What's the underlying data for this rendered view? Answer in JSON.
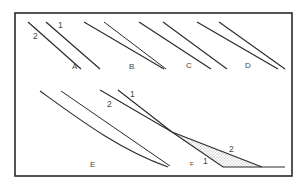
{
  "diagram": {
    "colors": {
      "background": "#ffffff",
      "frame": "#2a2a2a",
      "line": "#2a2a2a",
      "label": "#444444",
      "shade": "#bdbdbd"
    },
    "frame": {
      "x": 15,
      "y": 13,
      "width": 277,
      "height": 163
    },
    "panels": [
      {
        "id": "A",
        "label": "A",
        "label_pos": [
          72,
          69
        ],
        "lines": [
          {
            "name": "1",
            "points": [
              [
                46,
                22
              ],
              [
                100,
                69
              ]
            ]
          },
          {
            "name": "2",
            "points": [
              [
                28,
                22
              ],
              [
                81,
                69
              ]
            ]
          }
        ],
        "line_labels": [
          {
            "text": "1",
            "pos": [
              58,
              28
            ]
          },
          {
            "text": "2",
            "pos": [
              33,
              39
            ]
          }
        ]
      },
      {
        "id": "B",
        "label": "B",
        "label_pos": [
          129,
          69
        ],
        "lines": [
          {
            "name": "1",
            "points": [
              [
                104,
                22
              ],
              [
                166,
                69
              ]
            ]
          },
          {
            "name": "2",
            "points": [
              [
                84,
                22
              ],
              [
                164,
                69
              ]
            ]
          }
        ]
      },
      {
        "id": "C",
        "label": "C",
        "label_pos": [
          186,
          68
        ],
        "lines": [
          {
            "name": "1",
            "points": [
              [
                163,
                22
              ],
              [
                227,
                69
              ]
            ]
          },
          {
            "name": "2",
            "points": [
              [
                139,
                22
              ],
              [
                211,
                69
              ]
            ]
          }
        ]
      },
      {
        "id": "D",
        "label": "D",
        "label_pos": [
          245,
          68
        ],
        "lines": [
          {
            "name": "1",
            "points": [
              [
                219,
                22
              ],
              [
                285,
                69
              ]
            ]
          },
          {
            "name": "2",
            "points": [
              [
                197,
                22
              ],
              [
                278,
                69
              ]
            ]
          }
        ]
      },
      {
        "id": "E",
        "label": "E",
        "label_pos": [
          90,
          167
        ],
        "lines": [
          {
            "name": "curve",
            "path": "M40 91 C 80 120, 120 150, 168 167"
          },
          {
            "name": "straight",
            "points": [
              [
                61,
                91
              ],
              [
                170,
                166
              ]
            ]
          }
        ]
      },
      {
        "id": "F",
        "label": "F",
        "label_pos": [
          190,
          166
        ],
        "lines": [
          {
            "name": "1",
            "points": [
              [
                118,
                90
              ],
              [
                172,
                132
              ],
              [
                223,
                167
              ],
              [
                285,
                167
              ]
            ]
          },
          {
            "name": "2",
            "points": [
              [
                100,
                90
              ],
              [
                172,
                132
              ],
              [
                262,
                167
              ]
            ]
          }
        ],
        "shaded_region": [
          [
            172,
            132
          ],
          [
            223,
            167
          ],
          [
            262,
            167
          ]
        ],
        "line_labels": [
          {
            "text": "1",
            "pos": [
              130,
              97
            ]
          },
          {
            "text": "2",
            "pos": [
              107,
              107
            ]
          },
          {
            "text": "2",
            "pos": [
              229,
              152
            ]
          },
          {
            "text": "1",
            "pos": [
              203,
              164
            ]
          }
        ]
      }
    ]
  }
}
